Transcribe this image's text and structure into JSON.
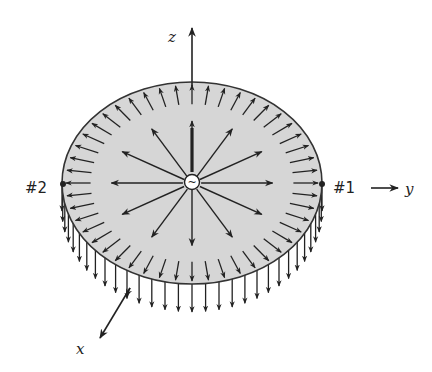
{
  "diagram": {
    "axes": {
      "z_label": "z",
      "y_label": "y",
      "x_label": "x"
    },
    "points": {
      "p1_label": "#1",
      "p2_label": "#2"
    },
    "source": {
      "symbol": "~",
      "icon": "ac-source-icon"
    },
    "colors": {
      "disk_fill": "#d6d6d6",
      "stroke": "#222222",
      "background": "#ffffff"
    },
    "geometry": {
      "center_x": 192,
      "center_y": 183,
      "rx": 130,
      "ry": 101,
      "inner_arrow_count": 12,
      "rim_arrow_count": 48,
      "edge_arrow_count": 30
    }
  }
}
